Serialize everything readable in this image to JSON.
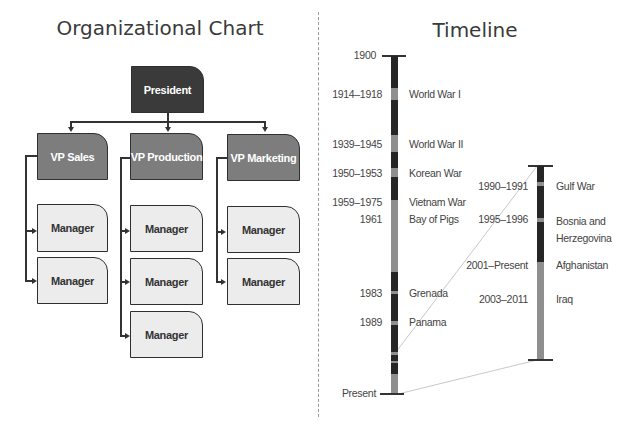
{
  "org_chart": {
    "title": "Organizational Chart",
    "president": {
      "label": "President"
    },
    "vps": [
      {
        "label": "VP Sales",
        "managers": [
          "Manager",
          "Manager"
        ]
      },
      {
        "label": "VP Production",
        "managers": [
          "Manager",
          "Manager",
          "Manager"
        ]
      },
      {
        "label": "VP Marketing",
        "managers": [
          "Manager",
          "Manager"
        ]
      }
    ],
    "colors": {
      "president": "#3a3a3a",
      "vp": "#7d7d7d",
      "manager": "#ececec",
      "lines": "#333333"
    }
  },
  "timeline": {
    "title": "Timeline",
    "start_label": "1900",
    "end_label": "Present",
    "main_events": [
      {
        "dates": "1914–1918",
        "name": "World War I"
      },
      {
        "dates": "1939–1945",
        "name": "World War II"
      },
      {
        "dates": "1950–1953",
        "name": "Korean War"
      },
      {
        "dates": "1959–1975",
        "name": "Vietnam War"
      },
      {
        "dates": "1961",
        "name": "Bay of Pigs"
      },
      {
        "dates": "1983",
        "name": "Grenada"
      },
      {
        "dates": "1989",
        "name": "Panama"
      }
    ],
    "zoom_events": [
      {
        "dates": "1990–1991",
        "name": "Gulf War"
      },
      {
        "dates": "1995–1996",
        "name": "Bosnia and Herzegovina"
      },
      {
        "dates": "2001–Present",
        "name": "Afghanistan"
      },
      {
        "dates": "2003–2011",
        "name": "Iraq"
      }
    ],
    "colors": {
      "peace": "#262626",
      "war": "#8f8f8f",
      "connector": "#c8c8c8"
    }
  }
}
